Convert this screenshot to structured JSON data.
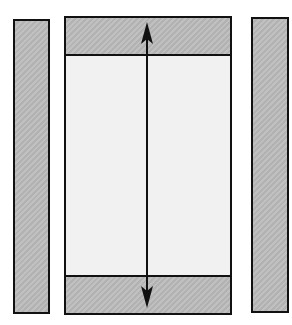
{
  "diagram": {
    "colors": {
      "hatch_fill": "#b9b9b9",
      "center_fill": "#f1f1f1",
      "stroke": "#111111",
      "background": "#ffffff"
    },
    "elements": [
      {
        "id": "left-bar",
        "type": "hatched-rectangle"
      },
      {
        "id": "center-panel",
        "type": "rectangle",
        "bands": [
          "top-hatched-band",
          "bottom-hatched-band"
        ]
      },
      {
        "id": "right-bar",
        "type": "hatched-rectangle"
      },
      {
        "id": "height-arrow",
        "type": "double-headed-vertical-arrow"
      }
    ]
  }
}
